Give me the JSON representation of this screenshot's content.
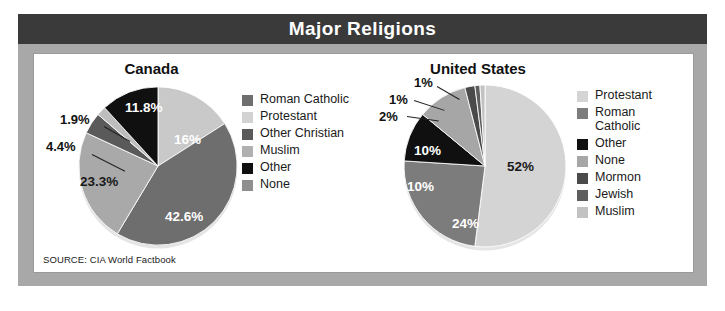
{
  "header": {
    "title": "Major Religions"
  },
  "source": {
    "text": "SOURCE: CIA World Factbook"
  },
  "colors": {
    "frame": "#a8a8a8",
    "title_bar": "#3a3a3a",
    "title_text": "#ffffff",
    "panel": "#ffffff",
    "grey_dark": "#6e6e6e",
    "grey_medium": "#8f8f8f",
    "grey_light": "#c9c9c9",
    "grey_lighter": "#d8d8d8",
    "black": "#101010",
    "grey_mid_dark": "#5a5a5a"
  },
  "chart_data": [
    {
      "type": "pie",
      "title": "Canada",
      "categories": [
        "Roman Catholic",
        "Protestant",
        "Other Christian",
        "Muslim",
        "Other",
        "None"
      ],
      "values": [
        42.6,
        16,
        4.4,
        1.9,
        11.8,
        23.3
      ],
      "labels": [
        "42.6%",
        "16%",
        "4.4%",
        "1.9%",
        "11.8%",
        "23.3%"
      ],
      "colors": [
        "#6e6e6e",
        "#c9c9c9",
        "#5a5a5a",
        "#a6a6a6",
        "#101010",
        "#8f8f8f"
      ],
      "legend_position": "right",
      "draw_order": [
        "Protestant",
        "Roman Catholic",
        "None",
        "Other Christian",
        "Muslim",
        "Other"
      ],
      "draw_values": [
        16,
        42.6,
        23.3,
        4.4,
        1.9,
        11.8
      ],
      "draw_colors": [
        "#c9c9c9",
        "#6e6e6e",
        "#a9a9a9",
        "#5a5a5a",
        "#bdbdbd",
        "#101010"
      ],
      "inside_labels": [
        {
          "text": "16%",
          "tone": "light"
        },
        {
          "text": "42.6%",
          "tone": "light"
        },
        {
          "text": "23.3%",
          "tone": "dark"
        },
        {
          "text": "11.8%",
          "tone": "light"
        }
      ],
      "callouts": [
        {
          "text": "4.4%"
        },
        {
          "text": "1.9%"
        }
      ]
    },
    {
      "type": "pie",
      "title": "United States",
      "categories": [
        "Protestant",
        "Roman Catholic",
        "Other",
        "None",
        "Mormon",
        "Jewish",
        "Muslim"
      ],
      "values": [
        52,
        24,
        10,
        10,
        2,
        1,
        1
      ],
      "labels": [
        "52%",
        "24%",
        "10%",
        "10%",
        "2%",
        "1%",
        "1%"
      ],
      "colors": [
        "#d4d4d4",
        "#7c7c7c",
        "#101010",
        "#a6a6a6",
        "#4a4a4a",
        "#5e5e5e",
        "#c9c9c9"
      ],
      "legend_position": "right",
      "draw_order": [
        "Protestant",
        "Roman Catholic",
        "Other",
        "None",
        "Mormon",
        "Jewish",
        "Muslim"
      ],
      "draw_values": [
        52,
        24,
        10,
        10,
        2,
        1,
        1
      ],
      "draw_colors": [
        "#d4d4d4",
        "#7c7c7c",
        "#101010",
        "#a6a6a6",
        "#4a4a4a",
        "#5e5e5e",
        "#c2c2c2"
      ],
      "inside_labels": [
        {
          "text": "52%",
          "tone": "dark"
        },
        {
          "text": "24%",
          "tone": "light"
        },
        {
          "text": "10%",
          "tone": "light"
        },
        {
          "text": "10%",
          "tone": "light"
        }
      ],
      "callouts": [
        {
          "text": "2%"
        },
        {
          "text": "1%"
        },
        {
          "text": "1%"
        }
      ]
    }
  ],
  "canada": {
    "title": "Canada",
    "legend": [
      {
        "label": "Roman Catholic",
        "color": "#6e6e6e"
      },
      {
        "label": "Protestant",
        "color": "#d2d2d2"
      },
      {
        "label": "Other Christian",
        "color": "#5a5a5a"
      },
      {
        "label": "Muslim",
        "color": "#b0b0b0"
      },
      {
        "label": "Other",
        "color": "#101010"
      },
      {
        "label": "None",
        "color": "#8f8f8f"
      }
    ],
    "slice_labels": {
      "protestant": "16%",
      "roman_catholic": "42.6%",
      "none": "23.3%",
      "other_christian": "4.4%",
      "muslim": "1.9%",
      "other": "11.8%"
    }
  },
  "united_states": {
    "title": "United States",
    "legend": [
      {
        "label": "Protestant",
        "color": "#d4d4d4"
      },
      {
        "label": "Roman\nCatholic",
        "color": "#7c7c7c"
      },
      {
        "label": "Other",
        "color": "#101010"
      },
      {
        "label": "None",
        "color": "#a6a6a6"
      },
      {
        "label": "Mormon",
        "color": "#4a4a4a"
      },
      {
        "label": "Jewish",
        "color": "#5e5e5e"
      },
      {
        "label": "Muslim",
        "color": "#c2c2c2"
      }
    ],
    "slice_labels": {
      "protestant": "52%",
      "roman_catholic": "24%",
      "other": "10%",
      "none": "10%",
      "mormon": "2%",
      "jewish": "1%",
      "muslim": "1%"
    }
  }
}
